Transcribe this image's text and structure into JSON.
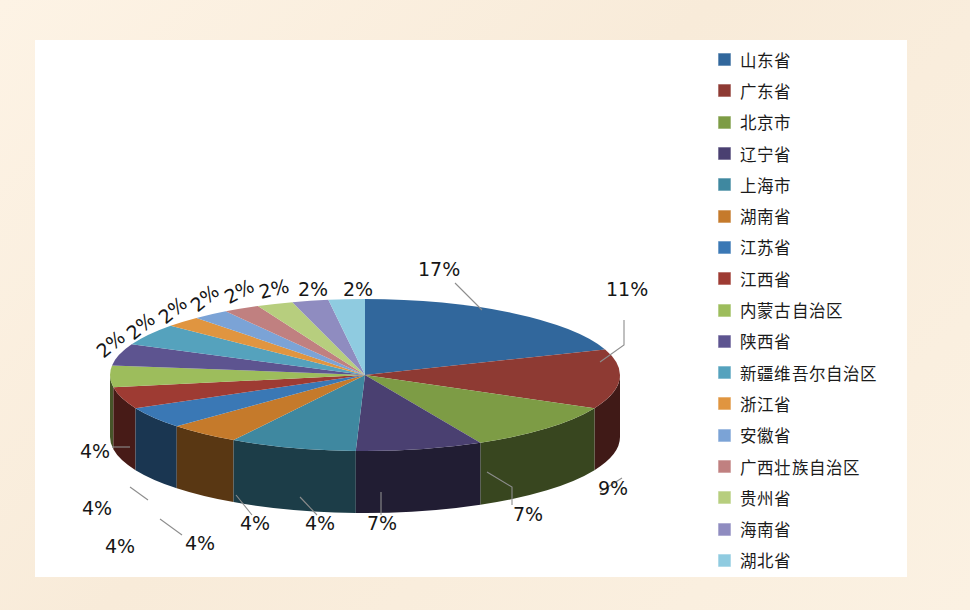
{
  "figure": {
    "background_color": "#fbf1e2",
    "plot_background_color": "#ffffff",
    "type": "3d-pie"
  },
  "legend": {
    "position": "right",
    "items": [
      {
        "label": "山东省",
        "color": "#31679c"
      },
      {
        "label": "广东省",
        "color": "#8e3a33"
      },
      {
        "label": "北京市",
        "color": "#7d9c45"
      },
      {
        "label": "辽宁省",
        "color": "#4a4071"
      },
      {
        "label": "上海市",
        "color": "#3f88a0"
      },
      {
        "label": "湖南省",
        "color": "#c57a2b"
      },
      {
        "label": "江苏省",
        "color": "#3a78b5"
      },
      {
        "label": "江西省",
        "color": "#9e3b33"
      },
      {
        "label": "内蒙古自治区",
        "color": "#9dbd5c"
      },
      {
        "label": "陕西省",
        "color": "#5d5490"
      },
      {
        "label": "新疆维吾尔自治区",
        "color": "#55a2bd"
      },
      {
        "label": "浙江省",
        "color": "#e09540"
      },
      {
        "label": "安徽省",
        "color": "#7ba3d6"
      },
      {
        "label": "广西壮族自治区",
        "color": "#c08080"
      },
      {
        "label": "贵州省",
        "color": "#b7ce7e"
      },
      {
        "label": "海南省",
        "color": "#8f8cc0"
      },
      {
        "label": "湖北省",
        "color": "#8fcbe0"
      }
    ]
  },
  "chart_data": {
    "type": "pie",
    "title": "",
    "subtitle": "",
    "xlabel": "",
    "ylabel": "",
    "legend_position": "right",
    "grid": false,
    "labels_shown": "percent",
    "categories": [
      "山东省",
      "广东省",
      "北京市",
      "辽宁省",
      "上海市",
      "湖南省",
      "江苏省",
      "江西省",
      "内蒙古自治区",
      "陕西省",
      "新疆维吾尔自治区",
      "浙江省",
      "安徽省",
      "广西壮族自治区",
      "贵州省",
      "海南省",
      "湖北省"
    ],
    "values": [
      17,
      11,
      9,
      7,
      7,
      4,
      4,
      4,
      4,
      4,
      4,
      2,
      2,
      2,
      2,
      2,
      2
    ],
    "value_labels": [
      "17%",
      "11%",
      "9%",
      "7%",
      "7%",
      "4%",
      "4%",
      "4%",
      "4%",
      "4%",
      "4%",
      "2%",
      "2%",
      "2%",
      "2%",
      "2%",
      "2%"
    ],
    "colors": [
      "#31679c",
      "#8e3a33",
      "#7d9c45",
      "#4a4071",
      "#3f88a0",
      "#c57a2b",
      "#3a78b5",
      "#9e3b33",
      "#9dbd5c",
      "#5d5490",
      "#55a2bd",
      "#e09540",
      "#7ba3d6",
      "#c08080",
      "#b7ce7e",
      "#8f8cc0",
      "#8fcbe0"
    ]
  }
}
